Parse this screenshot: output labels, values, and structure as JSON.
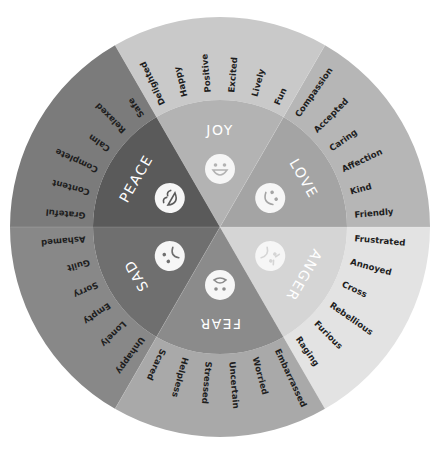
{
  "diagram": {
    "type": "emotion-wheel",
    "center": [
      220,
      227
    ],
    "outer_radius": 210,
    "ring_radius": 127,
    "sectors": [
      {
        "name": "JOY",
        "start_angle": 240,
        "end_angle": 300,
        "inner_color": "#b3b3b3",
        "outer_color": "#c9c9c9",
        "face": "big-grin",
        "words": [
          "Delighted",
          "Happy",
          "Positive",
          "Excited",
          "Lively",
          "Fun"
        ]
      },
      {
        "name": "LOVE",
        "start_angle": 300,
        "end_angle": 360,
        "inner_color": "#a4a4a4",
        "outer_color": "#b6b6b6",
        "face": "wink-smile",
        "words": [
          "Compassion",
          "Accepted",
          "Caring",
          "Affection",
          "Kind",
          "Friendly"
        ]
      },
      {
        "name": "ANGER",
        "start_angle": 0,
        "end_angle": 60,
        "inner_color": "#d5d5d5",
        "outer_color": "#e3e3e3",
        "face": "angry",
        "words": [
          "Frustrated",
          "Annoyed",
          "Cross",
          "Rebellious",
          "Furious",
          "Raging"
        ]
      },
      {
        "name": "FEAR",
        "start_angle": 60,
        "end_angle": 120,
        "inner_color": "#8b8b8b",
        "outer_color": "#a9a9a9",
        "face": "scared",
        "words": [
          "Embarrassed",
          "Worried",
          "Uncertain",
          "Stressed",
          "Helpless",
          "Scared"
        ]
      },
      {
        "name": "SAD",
        "start_angle": 120,
        "end_angle": 180,
        "inner_color": "#6f6f6f",
        "outer_color": "#888888",
        "face": "frown",
        "words": [
          "Unhappy",
          "Lonely",
          "Empty",
          "Sorry",
          "Guilt",
          "Ashamed"
        ]
      },
      {
        "name": "PEACE",
        "start_angle": 180,
        "end_angle": 240,
        "inner_color": "#5a5a5a",
        "outer_color": "#7b7b7b",
        "face": "content",
        "words": [
          "Grateful",
          "Content",
          "Complete",
          "Calm",
          "Relaxed",
          "Safe"
        ]
      }
    ]
  }
}
